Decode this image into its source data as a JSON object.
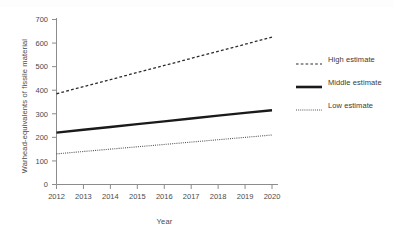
{
  "chart_data": {
    "type": "line",
    "title": "",
    "xlabel": "Year",
    "ylabel": "Warhead-equivalents of fissile material",
    "x": [
      2012,
      2013,
      2014,
      2015,
      2016,
      2017,
      2018,
      2019,
      2020
    ],
    "xtick_labels": [
      "2012",
      "2013",
      "2014",
      "2015",
      "2016",
      "2017",
      "2018",
      "2019",
      "2020"
    ],
    "ytick_labels": [
      "0",
      "100",
      "200",
      "300",
      "400",
      "500",
      "600",
      "700"
    ],
    "yticks": [
      0,
      100,
      200,
      300,
      400,
      500,
      600,
      700
    ],
    "xlim": [
      2012,
      2020
    ],
    "ylim": [
      0,
      700
    ],
    "grid": false,
    "legend_position": "right",
    "series": [
      {
        "name": "High estimate",
        "style": "dashed",
        "color": "#2b2b2b",
        "values": [
          385,
          415,
          445,
          475,
          505,
          535,
          565,
          595,
          625
        ]
      },
      {
        "name": "Middle estimate",
        "style": "solid",
        "color": "#1a1a1a",
        "values": [
          220,
          232,
          244,
          256,
          268,
          280,
          292,
          304,
          315
        ]
      },
      {
        "name": "Low estimate",
        "style": "dotted",
        "color": "#555555",
        "values": [
          130,
          140,
          150,
          160,
          170,
          180,
          190,
          200,
          210
        ]
      }
    ]
  },
  "legend": {
    "items": [
      {
        "label": "High estimate"
      },
      {
        "label": "Middle estimate"
      },
      {
        "label": "Low estimate"
      }
    ]
  },
  "axes": {
    "x_title": "Year",
    "y_title": "Warhead-equivalents of fissile material"
  }
}
